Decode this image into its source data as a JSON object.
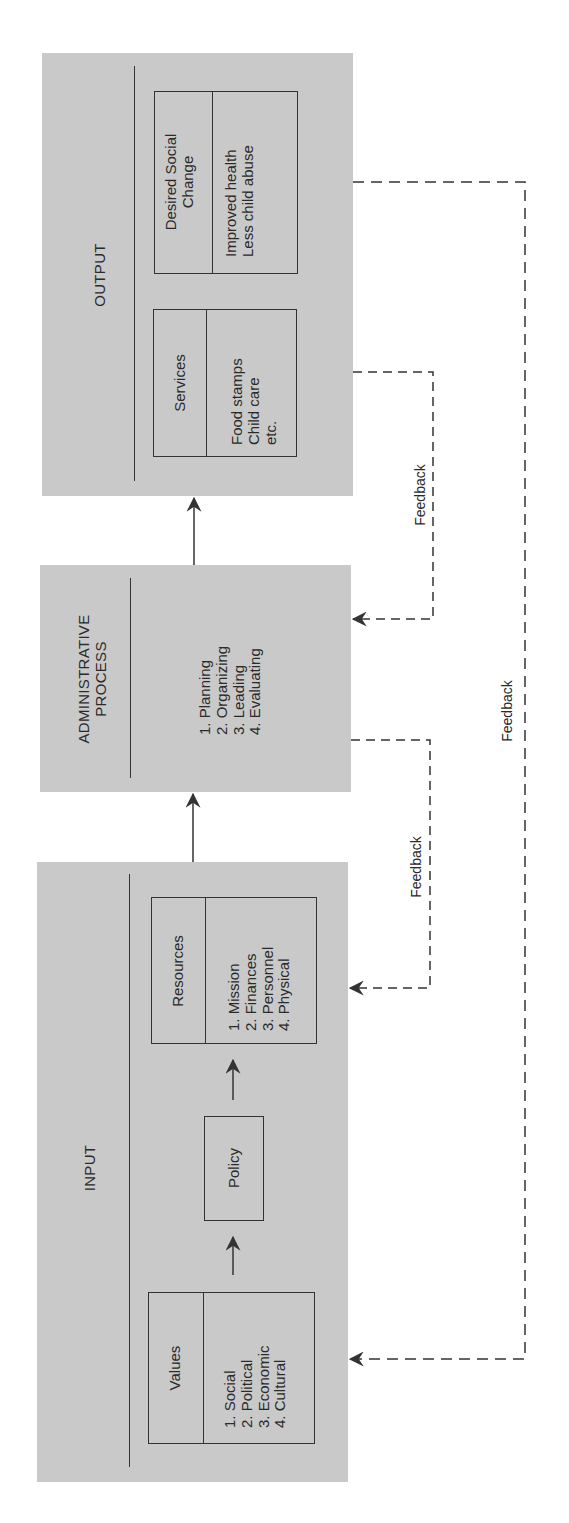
{
  "diagram": {
    "orientation": "rotated-90-ccw",
    "colors": {
      "panel_fill": "#c9c9c9",
      "stroke": "#333333",
      "background": "#ffffff"
    },
    "input": {
      "title": "INPUT",
      "values": {
        "title": "Values",
        "items_text": "1. Social\n2. Political\n3. Economic\n4. Cultural",
        "items": [
          "1. Social",
          "2. Political",
          "3. Economic",
          "4. Cultural"
        ]
      },
      "policy": {
        "title": "Policy"
      },
      "resources": {
        "title": "Resources",
        "items_text": "1. Mission\n2. Finances\n3. Personnel\n4. Physical",
        "items": [
          "1. Mission",
          "2. Finances",
          "3. Personnel",
          "4. Physical"
        ]
      }
    },
    "administrative_process": {
      "title": "ADMINISTRATIVE\nPROCESS",
      "items_text": "1. Planning\n2. Organizing\n3. Leading\n4. Evaluating",
      "items": [
        "1. Planning",
        "2. Organizing",
        "3. Leading",
        "4. Evaluating"
      ]
    },
    "output": {
      "title": "OUTPUT",
      "services": {
        "title": "Services",
        "items_text": "Food stamps\nChild care\netc.",
        "items": [
          "Food stamps",
          "Child care",
          "etc."
        ]
      },
      "desired_social_change": {
        "title": "Desired Social\nChange",
        "items_text": "Improved health\nLess child abuse",
        "items": [
          "Improved health",
          "Less child abuse"
        ]
      }
    },
    "feedback_loops": [
      {
        "label": "Feedback",
        "from": "Services",
        "to": "Administrative Process"
      },
      {
        "label": "Feedback",
        "from": "Administrative Process",
        "to": "Resources"
      },
      {
        "label": "Feedback",
        "from": "Desired Social Change",
        "to": "Values"
      }
    ],
    "flow_arrows": [
      {
        "from": "Values",
        "to": "Policy"
      },
      {
        "from": "Policy",
        "to": "Resources"
      },
      {
        "from": "Input",
        "to": "Administrative Process"
      },
      {
        "from": "Administrative Process",
        "to": "Output"
      }
    ]
  }
}
